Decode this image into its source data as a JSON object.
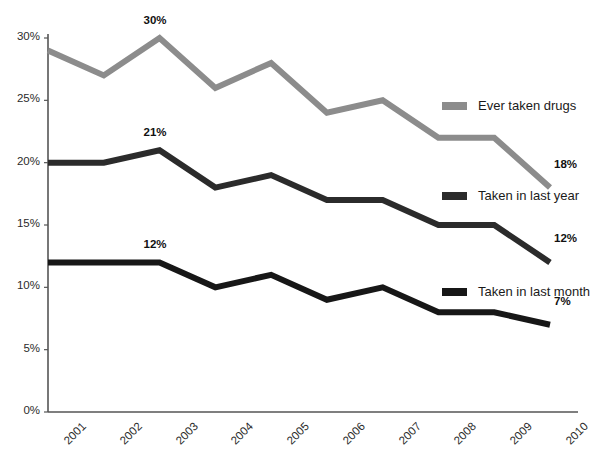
{
  "chart_data": {
    "type": "line",
    "title": "",
    "subtitle": "",
    "xlabel": "",
    "ylabel": "",
    "categories": [
      "2001",
      "2002",
      "2003",
      "2004",
      "2005",
      "2006",
      "2007",
      "2008",
      "2009",
      "2010"
    ],
    "ylim": [
      0,
      30
    ],
    "xlim_categories": [
      "2001",
      "2010"
    ],
    "y_ticks": [
      "0%",
      "5%",
      "10%",
      "15%",
      "20%",
      "25%",
      "30%"
    ],
    "y_tick_values": [
      0,
      5,
      10,
      15,
      20,
      25,
      30
    ],
    "grid": false,
    "legend_position": "right-inside",
    "series": [
      {
        "name": "Ever taken drugs",
        "color": "#8c8c8c",
        "values": [
          29,
          27,
          30,
          26,
          28,
          24,
          25,
          22,
          22,
          18
        ],
        "annotations": [
          {
            "category": "2003",
            "value": 30,
            "text": "30%",
            "position": "above"
          },
          {
            "category": "2010",
            "value": 18,
            "text": "18%",
            "position": "above-right"
          }
        ]
      },
      {
        "name": "Taken in last year",
        "color": "#2b2b2b",
        "values": [
          20,
          20,
          21,
          18,
          19,
          17,
          17,
          15,
          15,
          12
        ],
        "annotations": [
          {
            "category": "2003",
            "value": 21,
            "text": "21%",
            "position": "above"
          },
          {
            "category": "2010",
            "value": 12,
            "text": "12%",
            "position": "above-right"
          }
        ]
      },
      {
        "name": "Taken in last month",
        "color": "#171717",
        "values": [
          12,
          12,
          12,
          10,
          11,
          9,
          10,
          8,
          8,
          7
        ],
        "annotations": [
          {
            "category": "2003",
            "value": 12,
            "text": "12%",
            "position": "above"
          },
          {
            "category": "2010",
            "value": 7,
            "text": "7%",
            "position": "above-right"
          }
        ]
      }
    ]
  },
  "axes": {
    "y_labels": [
      "30%",
      "25%",
      "20%",
      "15%",
      "10%",
      "5%",
      "0%"
    ],
    "x_labels": [
      "2001",
      "2002",
      "2003",
      "2004",
      "2005",
      "2006",
      "2007",
      "2008",
      "2009",
      "2010"
    ],
    "axis_color": "#555555"
  },
  "annotations": {
    "gray_peak": "30%",
    "gray_end": "18%",
    "mid_peak": "21%",
    "mid_end": "12%",
    "low_peak": "12%",
    "low_end": "7%"
  },
  "legend": {
    "items": [
      {
        "label": "Ever taken drugs",
        "color": "#8c8c8c"
      },
      {
        "label": "Taken in last year",
        "color": "#2b2b2b"
      },
      {
        "label": "Taken in last month",
        "color": "#171717"
      }
    ]
  }
}
